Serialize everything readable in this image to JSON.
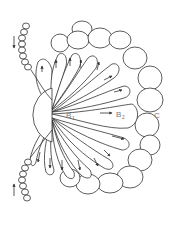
{
  "diagram": {
    "type": "biological-schematic",
    "labels": {
      "b1": "B",
      "b1_sub": "1",
      "b2": "B",
      "b2_sub": "2",
      "c": "C"
    },
    "arrows": {
      "count_radial": 16,
      "chain_arrows": 2
    },
    "colors": {
      "stroke": "#333333",
      "label": "#777777",
      "background": "#ffffff"
    }
  }
}
